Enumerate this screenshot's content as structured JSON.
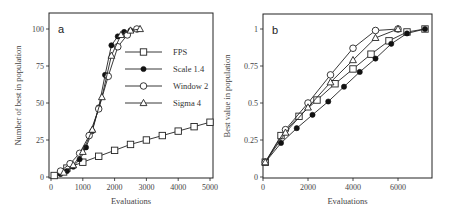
{
  "chart_data": [
    {
      "panel": "a",
      "type": "line",
      "title": "",
      "xlabel": "Evaluations",
      "ylabel": "Number of best in population",
      "xlim": [
        0,
        5100
      ],
      "ylim": [
        0,
        108
      ],
      "xticks": [
        0,
        1000,
        2000,
        3000,
        4000,
        5000
      ],
      "yticks": [
        0,
        25,
        50,
        75,
        100
      ],
      "grid": false,
      "legend_position": "upper right (inside)",
      "series": [
        {
          "name": "FPS",
          "marker": "square-open",
          "x": [
            100,
            500,
            1000,
            1500,
            2000,
            2500,
            3000,
            3500,
            4000,
            4500,
            5000
          ],
          "y": [
            1,
            6,
            10,
            14,
            18,
            22,
            25,
            28,
            31,
            34,
            37
          ]
        },
        {
          "name": "Scale 1.4",
          "marker": "diamond-filled",
          "x": [
            300,
            500,
            700,
            900,
            1100,
            1300,
            1500,
            1700,
            1900,
            2100,
            2300,
            2500
          ],
          "y": [
            2,
            4,
            7,
            12,
            20,
            31,
            47,
            69,
            89,
            95,
            98,
            99
          ]
        },
        {
          "name": "Window 2",
          "marker": "circle-open",
          "x": [
            300,
            600,
            900,
            1200,
            1500,
            1800,
            2100,
            2400,
            2700
          ],
          "y": [
            4,
            9,
            16,
            28,
            46,
            68,
            88,
            96,
            100
          ]
        },
        {
          "name": "Sigma 4",
          "marker": "triangle-open",
          "x": [
            400,
            700,
            1000,
            1300,
            1600,
            1900,
            2200,
            2500,
            2800
          ],
          "y": [
            3,
            8,
            17,
            32,
            54,
            82,
            96,
            99,
            100
          ]
        }
      ]
    },
    {
      "panel": "b",
      "type": "line",
      "title": "",
      "xlabel": "Evaluations",
      "ylabel": "Best value in population",
      "xlim": [
        0,
        7500
      ],
      "ylim": [
        0,
        1.08
      ],
      "xticks": [
        0,
        2000,
        4000,
        6000
      ],
      "yticks": [
        0,
        0.25,
        0.5,
        0.75,
        1
      ],
      "grid": false,
      "series": [
        {
          "name": "FPS",
          "marker": "square-open",
          "x": [
            100,
            800,
            1600,
            2400,
            3200,
            4000,
            4800,
            5600,
            6400,
            7200
          ],
          "y": [
            0.1,
            0.28,
            0.41,
            0.52,
            0.63,
            0.73,
            0.83,
            0.92,
            0.98,
            1.0
          ]
        },
        {
          "name": "Scale 1.4",
          "marker": "diamond-filled",
          "x": [
            100,
            800,
            1500,
            2200,
            2900,
            3600,
            4300,
            5000,
            5700,
            6400,
            7200
          ],
          "y": [
            0.1,
            0.23,
            0.33,
            0.42,
            0.51,
            0.61,
            0.71,
            0.8,
            0.9,
            0.97,
            1.0
          ]
        },
        {
          "name": "Window 2",
          "marker": "circle-open",
          "x": [
            100,
            1000,
            2000,
            3000,
            4000,
            5000,
            6000
          ],
          "y": [
            0.1,
            0.32,
            0.5,
            0.69,
            0.87,
            0.99,
            1.0
          ]
        },
        {
          "name": "Sigma 4",
          "marker": "triangle-open",
          "x": [
            100,
            1000,
            2000,
            3000,
            4000,
            5000,
            6000
          ],
          "y": [
            0.1,
            0.3,
            0.47,
            0.64,
            0.79,
            0.94,
            1.0
          ]
        }
      ]
    }
  ],
  "figure": {
    "panel_a_label": "a",
    "panel_b_label": "b",
    "legend": [
      "FPS",
      "Scale 1.4",
      "Window 2",
      "Sigma 4"
    ]
  }
}
